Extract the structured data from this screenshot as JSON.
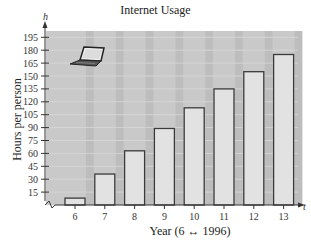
{
  "chart_data": {
    "type": "bar",
    "title": "Internet Usage",
    "xlabel": "Year (6 ↔ 1996)",
    "ylabel": "Hours per person",
    "x_axis_variable": "t",
    "y_axis_variable": "h",
    "categories": [
      "6",
      "7",
      "8",
      "9",
      "10",
      "11",
      "12",
      "13"
    ],
    "values": [
      8,
      36,
      63,
      89,
      113,
      135,
      155,
      175
    ],
    "yticks": [
      15,
      30,
      45,
      60,
      75,
      90,
      105,
      120,
      135,
      150,
      165,
      180,
      195
    ],
    "ylim": [
      0,
      200
    ],
    "y_axis_break": true,
    "grid": true,
    "legend": null,
    "decoration": "laptop-icon",
    "colors": {
      "plot_background": "#c9c9c9",
      "stripe": "#bdbdbd",
      "gridline": "#d9d9d9",
      "bar_fill": "#e2e2e2",
      "bar_stroke": "#3a3a3a"
    }
  }
}
